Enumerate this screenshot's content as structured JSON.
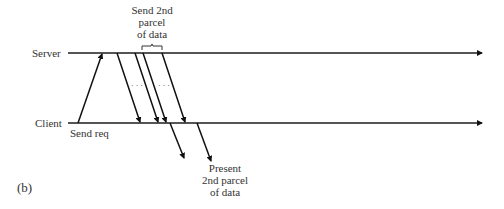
{
  "figure": {
    "panel_label": "(b)",
    "timelines": {
      "server": "Server",
      "client": "Client"
    },
    "annotations": {
      "send_req": "Send req",
      "send_2nd_parcel": [
        "Send 2nd",
        "parcel",
        "of data"
      ],
      "present_2nd_parcel": [
        "Present",
        "2nd parcel",
        "of data"
      ]
    },
    "ellipsis": "· · ·"
  }
}
